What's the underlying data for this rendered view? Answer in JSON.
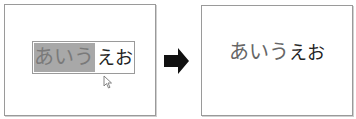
{
  "left_panel": {
    "input": {
      "selected_text": "あいう",
      "unselected_text": "えお"
    },
    "cursor_icon": "mouse-pointer-icon"
  },
  "arrow_icon": "right-arrow-icon",
  "right_panel": {
    "text_large": "あいう",
    "text_small": "えお"
  },
  "colors": {
    "selection": "#a8a8a8",
    "border": "#9a9a9a",
    "arrow": "#111111"
  }
}
